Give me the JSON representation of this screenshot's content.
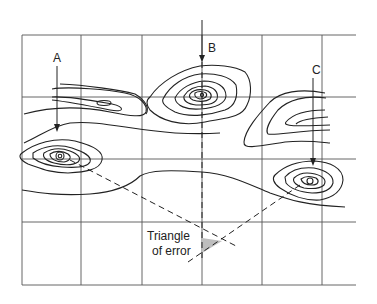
{
  "diagram": {
    "type": "resection-triangle-of-error",
    "points": [
      {
        "id": "A",
        "label": "A"
      },
      {
        "id": "B",
        "label": "B"
      },
      {
        "id": "C",
        "label": "C"
      }
    ],
    "annotation": {
      "line1": "Triangle",
      "line2": "of error"
    },
    "colors": {
      "ink": "#222222",
      "grid": "#555555",
      "triangle_fill": "#bdbdbd",
      "background": "#ffffff"
    }
  }
}
